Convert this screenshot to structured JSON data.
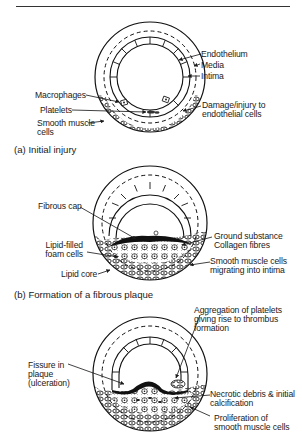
{
  "panels": [
    {
      "caption": "(a) Initial injury",
      "labels": {
        "endothelium": "Endothelium",
        "media": "Media",
        "intima": "Intima",
        "macrophages": "Macrophages",
        "platelets": "Platelets",
        "smooth_muscle": "Smooth muscle\ncells",
        "damage": "Damage/injury to\nendothelial cells"
      }
    },
    {
      "caption": "(b) Formation of a fibrous plaque",
      "labels": {
        "fibrous_cap": "Fibrous cap",
        "foam_cells": "Lipid-filled\nfoam cells",
        "lipid_core": "Lipid core",
        "ground_substance": "Ground substance\nCollagen fibres",
        "smc_migrating": "Smooth muscle cells\nmigrating into intima"
      }
    },
    {
      "caption": "",
      "labels": {
        "aggregation": "Aggregation of platelets\ngiving rise to thrombus\nformation",
        "fissure": "Fissure in\nplaque\n(ulceration)",
        "necrotic": "Necrotic debris & initial\ncalcification",
        "proliferation": "Proliferation of\nsmooth muscle cells"
      }
    }
  ]
}
